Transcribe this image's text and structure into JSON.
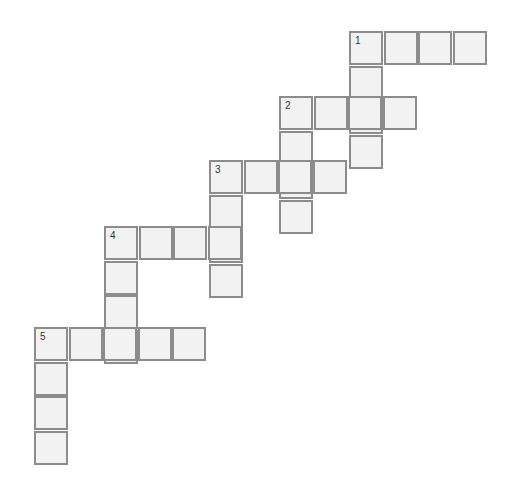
{
  "puzzle": {
    "cell_size": 34,
    "colors": {
      "cell_fill": "#f2f2f2",
      "cell_border": "#8c8c8c",
      "number": "#333333"
    },
    "words": [
      {
        "number": "1",
        "across": {
          "x": 349,
          "y": 31,
          "length": 4
        },
        "down": {
          "x": 349,
          "y": 31,
          "length": 4
        }
      },
      {
        "number": "2",
        "across": {
          "x": 279,
          "y": 96,
          "length": 4
        },
        "down": {
          "x": 279,
          "y": 96,
          "length": 4
        }
      },
      {
        "number": "3",
        "across": {
          "x": 209,
          "y": 160,
          "length": 4
        },
        "down": {
          "x": 209,
          "y": 160,
          "length": 4
        }
      },
      {
        "number": "4",
        "across": {
          "x": 104,
          "y": 226,
          "length": 4
        },
        "down": {
          "x": 104,
          "y": 226,
          "length": 4
        }
      },
      {
        "number": "5",
        "across": {
          "x": 34,
          "y": 327,
          "length": 5
        },
        "down": {
          "x": 34,
          "y": 327,
          "length": 4
        }
      }
    ]
  }
}
